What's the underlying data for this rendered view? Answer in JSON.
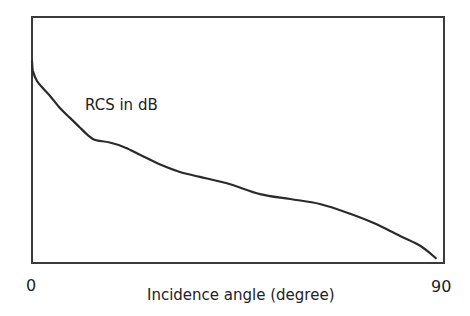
{
  "chart_data": {
    "type": "line",
    "title": "",
    "xlabel": "Incidence angle (degree)",
    "ylabel": "",
    "annotation": "RCS in dB",
    "xlim": [
      0,
      90
    ],
    "ylim": [
      0,
      1
    ],
    "x_tick_labels": [
      "0",
      "90"
    ],
    "y_tick_labels": [],
    "grid": false,
    "legend": "none",
    "colors": {
      "line": "#2a2a2a",
      "axes": "#3a3a3a",
      "text": "#222222"
    },
    "series": [
      {
        "name": "RCS in dB",
        "x": [
          0,
          0.2,
          1.1,
          2.4,
          3.9,
          6.1,
          8.3,
          10.5,
          12.2,
          13.8,
          17.0,
          20.3,
          23.6,
          28.0,
          32.3,
          36.7,
          43.3,
          49.8,
          56.4,
          62.9,
          69.5,
          74.9,
          80.4,
          84.8,
          88.2
        ],
        "y": [
          0.82,
          0.78,
          0.74,
          0.71,
          0.68,
          0.63,
          0.59,
          0.55,
          0.52,
          0.5,
          0.49,
          0.47,
          0.44,
          0.4,
          0.37,
          0.35,
          0.32,
          0.28,
          0.26,
          0.24,
          0.2,
          0.16,
          0.11,
          0.07,
          0.02
        ]
      }
    ]
  }
}
